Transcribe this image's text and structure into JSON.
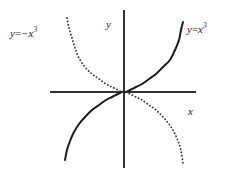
{
  "figure": {
    "name": "cubic-functions-graph",
    "background_color": "#ffffff",
    "width": 232,
    "height": 181
  },
  "chart_data": {
    "type": "line",
    "title": "",
    "xlabel": "x",
    "ylabel": "y",
    "grid": false,
    "legend_position": "inline-curve-labels",
    "axes": {
      "x_axis": {
        "label": "x",
        "orientation": "horizontal",
        "pixel_y": 92,
        "pixel_x_start": 50,
        "pixel_x_end": 196,
        "color": "#333333",
        "ticks": [],
        "tick_labels": []
      },
      "y_axis": {
        "label": "y",
        "orientation": "vertical",
        "pixel_x": 124,
        "pixel_y_start": 10,
        "pixel_y_end": 168,
        "color": "#333333",
        "ticks": [],
        "tick_labels": []
      },
      "origin": {
        "x": 124,
        "y": 92
      },
      "xlim": [
        -2.2,
        2.2
      ],
      "ylim": [
        -2.4,
        2.4
      ]
    },
    "series": [
      {
        "name": "y = x^3",
        "label": "y = x³",
        "expression": "x^3",
        "style": "solid",
        "color": "#1a1a1a",
        "line_width": 2,
        "x": [
          -1.75,
          -1.6,
          -1.45,
          -1.3,
          -1.15,
          -1.0,
          -0.85,
          -0.7,
          -0.55,
          -0.4,
          -0.25,
          -0.1,
          0,
          0.1,
          0.25,
          0.4,
          0.55,
          0.7,
          0.85,
          1.0,
          1.15,
          1.3,
          1.45,
          1.6,
          1.75
        ],
        "y": [
          -5.36,
          -4.1,
          -3.05,
          -2.2,
          -1.52,
          -1.0,
          -0.61,
          -0.34,
          -0.17,
          -0.064,
          -0.016,
          -0.001,
          0,
          0.001,
          0.016,
          0.064,
          0.17,
          0.34,
          0.61,
          1.0,
          1.52,
          2.2,
          3.05,
          4.1,
          5.36
        ],
        "pixel_points": [
          [
            65,
            160
          ],
          [
            67,
            150
          ],
          [
            70,
            141
          ],
          [
            74,
            132
          ],
          [
            79,
            124
          ],
          [
            85,
            117
          ],
          [
            92,
            110
          ],
          [
            99,
            105
          ],
          [
            106,
            100
          ],
          [
            112,
            97
          ],
          [
            118,
            94
          ],
          [
            122,
            92
          ],
          [
            124,
            92
          ],
          [
            126,
            92
          ],
          [
            130,
            90
          ],
          [
            136,
            87
          ],
          [
            142,
            84
          ],
          [
            149,
            79
          ],
          [
            156,
            74
          ],
          [
            163,
            67
          ],
          [
            170,
            60
          ],
          [
            175,
            50
          ],
          [
            179,
            40
          ],
          [
            181,
            30
          ],
          [
            183,
            22
          ]
        ]
      },
      {
        "name": "y = -x^3",
        "label": "y = −x³",
        "expression": "-x^3",
        "style": "dotted",
        "color": "#3a3a3a",
        "line_width": 1.8,
        "dot_spacing": 3.2,
        "x": [
          -1.75,
          -1.6,
          -1.45,
          -1.3,
          -1.15,
          -1.0,
          -0.85,
          -0.7,
          -0.55,
          -0.4,
          -0.25,
          -0.1,
          0,
          0.1,
          0.25,
          0.4,
          0.55,
          0.7,
          0.85,
          1.0,
          1.15,
          1.3,
          1.45,
          1.6,
          1.75
        ],
        "y": [
          5.36,
          4.1,
          3.05,
          2.2,
          1.52,
          1.0,
          0.61,
          0.34,
          0.17,
          0.064,
          0.016,
          0.001,
          0,
          -0.001,
          -0.016,
          -0.064,
          -0.17,
          -0.34,
          -0.61,
          -1.0,
          -1.52,
          -2.2,
          -3.05,
          -4.1,
          -5.36
        ],
        "pixel_points": [
          [
            67,
            18
          ],
          [
            69,
            28
          ],
          [
            72,
            38
          ],
          [
            75,
            48
          ],
          [
            79,
            58
          ],
          [
            85,
            67
          ],
          [
            92,
            74
          ],
          [
            99,
            79
          ],
          [
            106,
            84
          ],
          [
            112,
            87
          ],
          [
            118,
            90
          ],
          [
            122,
            92
          ],
          [
            124,
            92
          ],
          [
            126,
            92
          ],
          [
            130,
            94
          ],
          [
            136,
            97
          ],
          [
            142,
            100
          ],
          [
            149,
            105
          ],
          [
            156,
            110
          ],
          [
            163,
            117
          ],
          [
            169,
            124
          ],
          [
            174,
            132
          ],
          [
            178,
            141
          ],
          [
            181,
            151
          ],
          [
            183,
            163
          ]
        ]
      }
    ],
    "annotations": [
      {
        "text": "y = −x³",
        "x": 10,
        "y": 26,
        "target_series": "y = -x^3"
      },
      {
        "text": "y = x³",
        "x": 187,
        "y": 22,
        "target_series": "y = x^3"
      },
      {
        "text": "y",
        "x": 106,
        "y": 19,
        "target": "y-axis"
      },
      {
        "text": "x",
        "x": 188,
        "y": 106,
        "target": "x-axis"
      }
    ]
  },
  "labels": {
    "neg_cubic": {
      "lhs": "y",
      "operator": "=",
      "base": "−x",
      "exponent": "3"
    },
    "pos_cubic": {
      "lhs": "y",
      "operator": "=",
      "base": "x",
      "exponent": "3"
    },
    "y_axis": "y",
    "x_axis": "x"
  }
}
